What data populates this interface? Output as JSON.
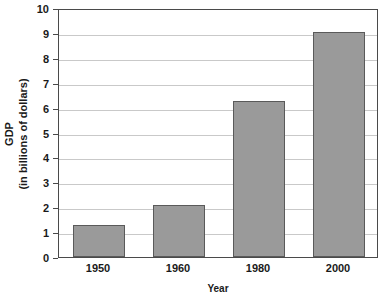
{
  "chart_data": {
    "type": "bar",
    "title_visible_fragment": "",
    "categories": [
      "1950",
      "1960",
      "1980",
      "2000"
    ],
    "values": [
      1.3,
      2.1,
      6.25,
      9.05
    ],
    "series": [
      {
        "name": "GDP",
        "values": [
          1.3,
          2.1,
          6.25,
          9.05
        ]
      }
    ],
    "xlabel": "Year",
    "ylabel": "GDP",
    "ylabel_line1": "GDP",
    "ylabel_line2": "(in billions of dollars)",
    "ylim": [
      0,
      10
    ],
    "ytick_step": 1,
    "yticks": [
      "10",
      "9",
      "8",
      "7",
      "6",
      "5",
      "4",
      "3",
      "2",
      "1",
      "0"
    ],
    "grid": true,
    "grid_axis": "y",
    "legend": false,
    "legend_position": "none",
    "bar_color": "#9a9a9a",
    "bar_edge_color": "#5a5a5a",
    "grid_color": "#c9c9c9",
    "axis_color": "#4a4a4a",
    "text_color": "#1a1a1a",
    "background": "#ffffff"
  }
}
